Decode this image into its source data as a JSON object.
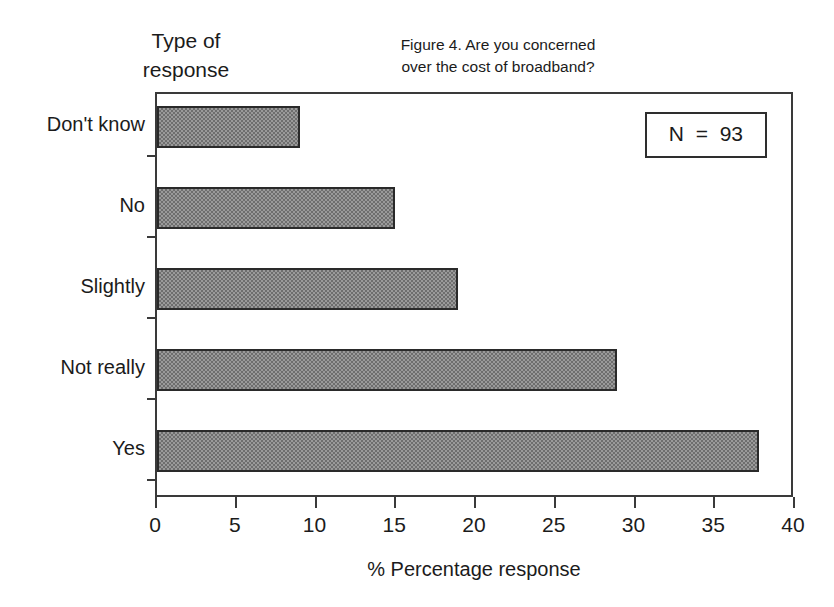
{
  "figure": {
    "title_line1": "Figure 4.  Are you concerned",
    "title_line2": "over the cost of broadband?",
    "y_group_label_line1": "Type of",
    "y_group_label_line2": "response",
    "annotation": "N  =  93"
  },
  "chart_data": {
    "type": "bar",
    "orientation": "horizontal",
    "title": "Figure 4.  Are you concerned over the cost of broadband?",
    "xlabel": "% Percentage response",
    "ylabel": "Type of response",
    "categories": [
      "Yes",
      "Not really",
      "Slightly",
      "No",
      "Don't know"
    ],
    "values": [
      38,
      29,
      19,
      15,
      9
    ],
    "xlim": [
      0,
      40
    ],
    "xticks": [
      0,
      5,
      10,
      15,
      20,
      25,
      30,
      35,
      40
    ],
    "xticklabels": [
      "0",
      "5",
      "10",
      "15",
      "20",
      "25",
      "30",
      "35",
      "40"
    ],
    "grid": false,
    "legend": false,
    "annotations": [
      "N  =  93"
    ],
    "bar_fill": "#9a9a9a",
    "bar_edge": "#2a2a2a",
    "axis_color": "#3a3a3a",
    "background": "#ffffff",
    "n_total": 93
  },
  "bars": [
    {
      "label": "Don't know",
      "value": 9,
      "left_pct": 0,
      "width_pct": 22.5,
      "top": 12,
      "label_top": 20
    },
    {
      "label": "No",
      "value": 15,
      "left_pct": 0,
      "width_pct": 37.5,
      "top": 93,
      "label_top": 101
    },
    {
      "label": "Slightly",
      "value": 19,
      "left_pct": 0,
      "width_pct": 47.5,
      "top": 174,
      "label_top": 182
    },
    {
      "label": "Not really",
      "value": 29,
      "left_pct": 0,
      "width_pct": 72.5,
      "top": 255,
      "label_top": 263
    },
    {
      "label": "Yes",
      "value": 38,
      "left_pct": 0,
      "width_pct": 95.0,
      "top": 336,
      "label_top": 344
    }
  ],
  "yticks": [
    {
      "top": 61
    },
    {
      "top": 142
    },
    {
      "top": 223
    },
    {
      "top": 304
    },
    {
      "top": 385
    }
  ],
  "xticks": [
    {
      "label": "0",
      "pct": 0
    },
    {
      "label": "5",
      "pct": 12.5
    },
    {
      "label": "10",
      "pct": 25
    },
    {
      "label": "15",
      "pct": 37.5
    },
    {
      "label": "20",
      "pct": 50
    },
    {
      "label": "25",
      "pct": 62.5
    },
    {
      "label": "30",
      "pct": 75
    },
    {
      "label": "35",
      "pct": 87.5
    },
    {
      "label": "40",
      "pct": 100
    }
  ]
}
